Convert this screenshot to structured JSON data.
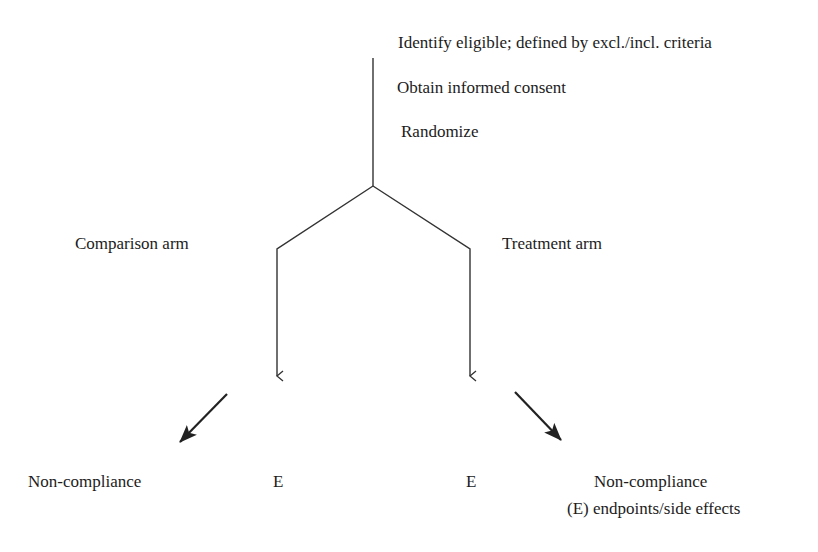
{
  "diagram": {
    "type": "randomized-trial-flow",
    "steps": [
      {
        "id": "identify",
        "label": "Identify eligible; defined by excl./incl. criteria"
      },
      {
        "id": "consent",
        "label": "Obtain informed consent"
      },
      {
        "id": "randomize",
        "label": "Randomize"
      }
    ],
    "arms": [
      {
        "id": "comparison",
        "label": "Comparison arm",
        "outcome_label": "E",
        "deviation_label": "Non-compliance"
      },
      {
        "id": "treatment",
        "label": "Treatment arm",
        "outcome_label": "E",
        "deviation_label": "Non-compliance"
      }
    ],
    "legend": {
      "note": "(E) endpoints/side effects"
    },
    "colors": {
      "line": "#333333",
      "text": "#1c1c1c",
      "background": "#ffffff"
    }
  }
}
